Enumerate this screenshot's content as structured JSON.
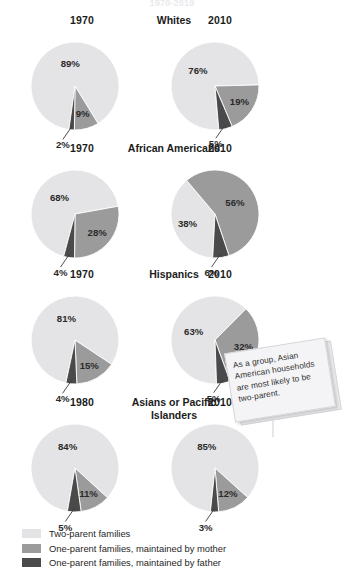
{
  "title": "1970-2010",
  "colors": {
    "two_parent": "#e4e4e6",
    "mother": "#9b9b9b",
    "father": "#4a4a4a",
    "text": "#1c1c1c",
    "note_bg": "#f4f4f6"
  },
  "legend": {
    "items": [
      {
        "label": "Two-parent families",
        "color": "#e4e4e6",
        "key": "two_parent"
      },
      {
        "label": "One-parent families, maintained by mother",
        "color": "#9b9b9b",
        "key": "mother"
      },
      {
        "label": "One-parent families, maintained by father",
        "color": "#4a4a4a",
        "key": "father"
      }
    ]
  },
  "note": {
    "text": "As a group, Asian American households are most likely to be two-parent."
  },
  "chart_data": {
    "type": "pie",
    "title": "1970-2010",
    "series_names": [
      "Two-parent families",
      "One-parent families, maintained by mother",
      "One-parent families, maintained by father"
    ],
    "units": "percent",
    "groups": [
      {
        "name": "Whites",
        "charts": [
          {
            "year": "1970",
            "values": [
              89,
              9,
              2
            ],
            "labels": [
              "89%",
              "9%",
              "2%"
            ],
            "callout_index": 2
          },
          {
            "year": "2010",
            "values": [
              76,
              19,
              5
            ],
            "labels": [
              "76%",
              "19%",
              "5%"
            ],
            "callout_index": 2
          }
        ]
      },
      {
        "name": "African Americans",
        "charts": [
          {
            "year": "1970",
            "values": [
              68,
              28,
              4
            ],
            "labels": [
              "68%",
              "28%",
              "4%"
            ],
            "callout_index": 2
          },
          {
            "year": "2010",
            "values": [
              38,
              56,
              6
            ],
            "labels": [
              "38%",
              "56%",
              "6%"
            ],
            "callout_index": 2
          }
        ]
      },
      {
        "name": "Hispanics",
        "charts": [
          {
            "year": "1970",
            "values": [
              81,
              15,
              4
            ],
            "labels": [
              "81%",
              "15%",
              "4%"
            ],
            "callout_index": 2
          },
          {
            "year": "2010",
            "values": [
              63,
              32,
              5
            ],
            "labels": [
              "63%",
              "32%",
              "5%"
            ],
            "callout_index": 2
          }
        ]
      },
      {
        "name": "Asians or Pacific Islanders",
        "charts": [
          {
            "year": "1980",
            "values": [
              84,
              11,
              5
            ],
            "labels": [
              "84%",
              "11%",
              "5%"
            ],
            "callout_index": 2
          },
          {
            "year": "2010",
            "values": [
              85,
              12,
              3
            ],
            "labels": [
              "85%",
              "12%",
              "3%"
            ],
            "callout_index": 2
          }
        ]
      }
    ]
  }
}
